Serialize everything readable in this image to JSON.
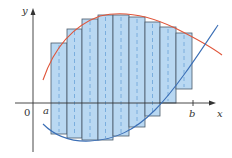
{
  "diagram": {
    "title": "",
    "labels": {
      "y_axis": "y",
      "x_axis": "x",
      "origin": "0",
      "a": "a",
      "b": "b"
    },
    "colors": {
      "rect_fill": "#b9d8f2",
      "rect_stroke": "#4a5a6a",
      "dash": "#6aa3d8",
      "top_curve": "#e0553a",
      "bottom_curve": "#3b6fb6",
      "axis": "#333333"
    },
    "rectangles": [
      {
        "x": 51,
        "w": 16,
        "top": 43,
        "bottom": 134
      },
      {
        "x": 67,
        "w": 15,
        "top": 29,
        "bottom": 138
      },
      {
        "x": 82,
        "w": 16,
        "top": 19,
        "bottom": 140
      },
      {
        "x": 98,
        "w": 15,
        "top": 15,
        "bottom": 140
      },
      {
        "x": 113,
        "w": 16,
        "top": 15,
        "bottom": 136
      },
      {
        "x": 129,
        "w": 16,
        "top": 17,
        "bottom": 127
      },
      {
        "x": 145,
        "w": 15,
        "top": 22,
        "bottom": 116
      },
      {
        "x": 160,
        "w": 16,
        "top": 27,
        "bottom": 103
      },
      {
        "x": 176,
        "w": 16,
        "top": 33,
        "bottom": 89
      }
    ]
  }
}
